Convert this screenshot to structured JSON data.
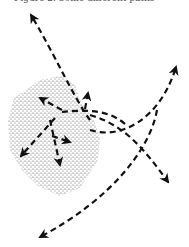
{
  "figure": {
    "caption_fragment": "Figure 2. Some different paths",
    "colors": {
      "ink": "#111111",
      "stipple": "#444444",
      "background": "#ffffff"
    },
    "region": {
      "name": "stippled-region",
      "points": [
        [
          14,
          98
        ],
        [
          40,
          80
        ],
        [
          60,
          76
        ],
        [
          75,
          84
        ],
        [
          80,
          100
        ],
        [
          94,
          120
        ],
        [
          100,
          138
        ],
        [
          98,
          160
        ],
        [
          80,
          188
        ],
        [
          60,
          196
        ],
        [
          38,
          186
        ],
        [
          22,
          170
        ],
        [
          10,
          150
        ],
        [
          8,
          120
        ]
      ]
    },
    "paths": [
      {
        "name": "path-top-left-to-crossing",
        "d": "M 90 120 C 75 100, 55 55, 31 15",
        "arrow_end": true
      },
      {
        "name": "path-crossing-to-upper-right",
        "d": "M 90 130 C 120 140, 160 120, 176 67",
        "arrow_end": true
      },
      {
        "name": "path-inner-up-left",
        "d": "M 62 110 L 40 98",
        "arrow_end": true
      },
      {
        "name": "path-inner-to-up",
        "d": "M 85 109 L 88 93",
        "arrow_end": true
      },
      {
        "name": "path-hub-right",
        "d": "M 62 112 C 80 110, 110 108, 127 126",
        "arrow_end": false
      },
      {
        "name": "path-hub-down-left",
        "d": "M 55 118 L 21 156",
        "arrow_end": true
      },
      {
        "name": "path-hub-down-right",
        "d": "M 52 136 L 70 142",
        "arrow_end": true
      },
      {
        "name": "path-hub-down",
        "d": "M 50 120 L 60 165",
        "arrow_end": true
      },
      {
        "name": "path-right-down",
        "d": "M 90 115 C 125 125, 145 150, 168 182",
        "arrow_end": true
      },
      {
        "name": "path-long-down-left",
        "d": "M 157 110 C 150 150, 110 200, 40 237",
        "arrow_end": true
      }
    ]
  }
}
